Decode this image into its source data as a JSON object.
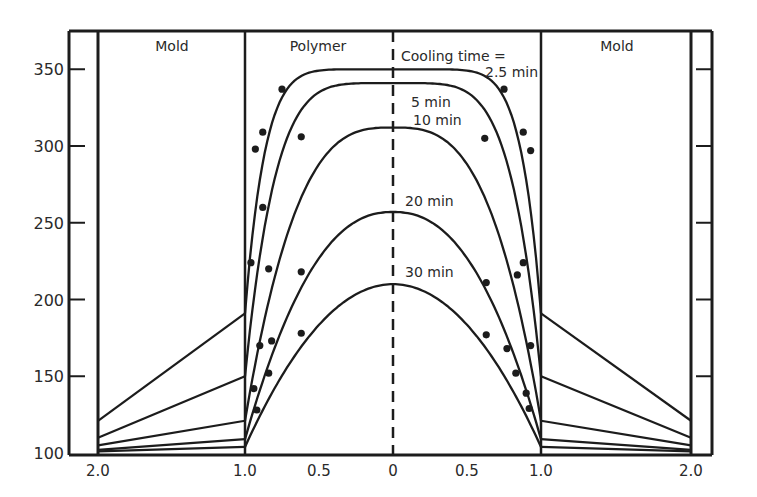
{
  "chart_data": {
    "type": "line",
    "title": "",
    "xlabel": "",
    "ylabel": "",
    "ylim": [
      100,
      370
    ],
    "y_ticks": [
      100,
      150,
      200,
      250,
      300,
      350
    ],
    "x_tick_labels": [
      "2.0",
      "1.0",
      "0.5",
      "0",
      "0.5",
      "1.0",
      "2.0"
    ],
    "x_tick_positions": [
      -2.0,
      -1.0,
      -0.5,
      0,
      0.5,
      1.0,
      2.0
    ],
    "regions": [
      {
        "name": "Mold",
        "x_range": [
          -2.0,
          -1.0
        ]
      },
      {
        "name": "Polymer",
        "x_range": [
          -1.0,
          1.0
        ]
      },
      {
        "name": "Mold",
        "x_range": [
          1.0,
          2.0
        ]
      }
    ],
    "annotation": "Cooling time =",
    "centerline": "dashed at x=0",
    "series": [
      {
        "name": "2.5 min",
        "label": "2.5 min",
        "peak": 350,
        "interface": 191,
        "mold_outer": 121,
        "points": [
          [
            -0.75,
            337
          ],
          [
            -0.93,
            298
          ],
          [
            -0.88,
            309
          ],
          [
            0.75,
            337
          ],
          [
            0.93,
            297
          ],
          [
            0.88,
            309
          ]
        ]
      },
      {
        "name": "5 min",
        "label": "5 min",
        "peak": 341,
        "interface": 150,
        "mold_outer": 110,
        "points": [
          [
            -0.62,
            306
          ],
          [
            -0.88,
            260
          ],
          [
            0.62,
            305
          ],
          [
            0.88,
            224
          ]
        ]
      },
      {
        "name": "10 min",
        "label": "10 min",
        "peak": 312,
        "interface": 121,
        "mold_outer": 105,
        "points": [
          [
            -0.96,
            224
          ],
          [
            -0.62,
            218
          ],
          [
            -0.84,
            220
          ],
          [
            -0.9,
            170
          ],
          [
            0.84,
            216
          ],
          [
            0.93,
            170
          ]
        ]
      },
      {
        "name": "20 min",
        "label": "20 min",
        "peak": 257,
        "interface": 109,
        "mold_outer": 102,
        "points": [
          [
            -0.94,
            142
          ],
          [
            -0.82,
            173
          ],
          [
            0.63,
            211
          ],
          [
            0.77,
            168
          ],
          [
            0.9,
            139
          ]
        ]
      },
      {
        "name": "30 min",
        "label": "30 min",
        "peak": 210,
        "interface": 104,
        "mold_outer": 101,
        "points": [
          [
            -0.92,
            128
          ],
          [
            -0.84,
            152
          ],
          [
            -0.62,
            178
          ],
          [
            0.63,
            177
          ],
          [
            0.83,
            152
          ],
          [
            0.92,
            129
          ]
        ]
      }
    ]
  },
  "labels": {
    "mold_left": "Mold",
    "polymer": "Polymer",
    "mold_right": "Mold",
    "cooling_time": "Cooling time =",
    "t25": "2.5 min",
    "t5": "5 min",
    "t10": "10 min",
    "t20": "20 min",
    "t30": "30 min"
  },
  "colors": {
    "ink": "#1c1c1c",
    "background": "#ffffff"
  }
}
